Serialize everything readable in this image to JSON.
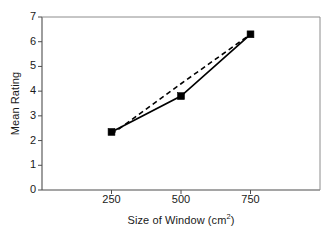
{
  "chart_data": {
    "type": "line",
    "title": "",
    "xlabel": "Size of Window (cm2)",
    "xlabel_base": "Size of Window (cm",
    "xlabel_sup": "2",
    "xlabel_close": ")",
    "ylabel": "Mean Rating",
    "x": [
      250,
      500,
      750
    ],
    "xlim": [
      0,
      1000
    ],
    "ylim": [
      0,
      7
    ],
    "xticks": [
      250,
      500,
      750
    ],
    "xticklabels": [
      "250",
      "500",
      "750"
    ],
    "yticks": [
      0,
      1,
      2,
      3,
      4,
      5,
      6,
      7
    ],
    "yticklabels": [
      "0",
      "1",
      "2",
      "3",
      "4",
      "5",
      "6",
      "7"
    ],
    "grid": false,
    "legend": null,
    "series": [
      {
        "name": "Mean Rating",
        "style": "solid",
        "marker": "filled-square",
        "color": "#000000",
        "values": [
          2.35,
          3.8,
          6.3
        ]
      },
      {
        "name": "Linear trend",
        "style": "dashed",
        "marker": "none",
        "color": "#000000",
        "values": [
          2.25,
          4.3,
          6.3
        ]
      }
    ],
    "annotations": []
  },
  "figure": {
    "background": "#ffffff",
    "frame_color": "#8c8c8c",
    "axis_color": "#4d4d4d",
    "tick_color": "#4d4d4d",
    "data_color": "#000000"
  }
}
